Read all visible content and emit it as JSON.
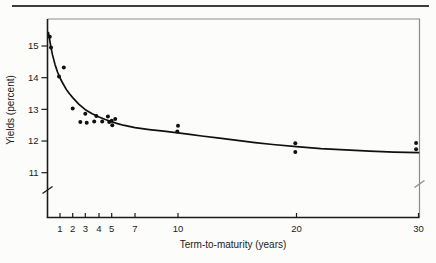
{
  "figure": {
    "background": "#fcfcfa",
    "rule_color": "#3c3c3c",
    "frame_color": "#8c8c8c",
    "axis_color": "#1b1b1b",
    "ink_color": "#101010"
  },
  "chart_data": {
    "type": "scatter",
    "title": "",
    "xlabel": "Term-to-maturity (years)",
    "ylabel": "Yields (percent)",
    "x_ticks": [
      1,
      2,
      3,
      4,
      5,
      7,
      10,
      20,
      30
    ],
    "y_ticks": [
      15,
      14,
      13,
      12,
      11
    ],
    "xlim": [
      0,
      30.5
    ],
    "ylim": [
      10.5,
      15.6
    ],
    "grid": false,
    "legend": false,
    "y_axis_break": true,
    "marker": "dot",
    "points": [
      [
        0.18,
        15.29
      ],
      [
        0.28,
        14.95
      ],
      [
        0.92,
        14.04
      ],
      [
        1.3,
        14.32
      ],
      [
        2.0,
        13.03
      ],
      [
        2.6,
        12.6
      ],
      [
        3.0,
        12.86
      ],
      [
        3.1,
        12.58
      ],
      [
        3.65,
        12.62
      ],
      [
        3.8,
        12.79
      ],
      [
        4.25,
        12.62
      ],
      [
        4.7,
        12.77
      ],
      [
        4.8,
        12.6
      ],
      [
        5.0,
        12.64
      ],
      [
        5.05,
        12.5
      ],
      [
        5.3,
        12.7
      ],
      [
        10,
        12.48
      ],
      [
        9.95,
        12.3
      ],
      [
        19.9,
        11.93
      ],
      [
        19.9,
        11.65
      ],
      [
        29.8,
        11.94
      ],
      [
        29.8,
        11.74
      ]
    ],
    "curve": [
      [
        0.08,
        15.42
      ],
      [
        0.15,
        15.25
      ],
      [
        0.25,
        15.02
      ],
      [
        0.4,
        14.72
      ],
      [
        0.6,
        14.42
      ],
      [
        0.8,
        14.18
      ],
      [
        1,
        13.99
      ],
      [
        1.25,
        13.8
      ],
      [
        1.5,
        13.63
      ],
      [
        1.75,
        13.49
      ],
      [
        2,
        13.37
      ],
      [
        2.5,
        13.16
      ],
      [
        3,
        12.99
      ],
      [
        3.5,
        12.86
      ],
      [
        4,
        12.76
      ],
      [
        4.5,
        12.68
      ],
      [
        5,
        12.61
      ],
      [
        5.5,
        12.55
      ],
      [
        6,
        12.5
      ],
      [
        7,
        12.42
      ],
      [
        8,
        12.36
      ],
      [
        9,
        12.31
      ],
      [
        10,
        12.26
      ],
      [
        11,
        12.21
      ],
      [
        12,
        12.16
      ],
      [
        13.5,
        12.09
      ],
      [
        15,
        12.02
      ],
      [
        16.5,
        11.95
      ],
      [
        18,
        11.89
      ],
      [
        20,
        11.82
      ],
      [
        22,
        11.76
      ],
      [
        24,
        11.72
      ],
      [
        26,
        11.68
      ],
      [
        28,
        11.65
      ],
      [
        30,
        11.63
      ]
    ]
  }
}
